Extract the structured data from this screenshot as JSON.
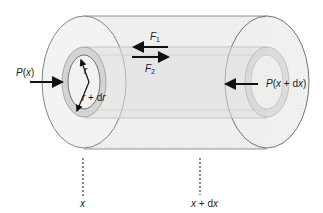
{
  "diagram": {
    "type": "fluid element cylinder (annular shell)",
    "labels": {
      "pressure_left": "P(x)",
      "pressure_right": "P(x + dx)",
      "force_1": "F",
      "force_1_sub": "1",
      "force_2": "F",
      "force_2_sub": "2",
      "radius_inner": "r",
      "radius_outer": "r + dr",
      "position_left": "x",
      "position_right": "x + dx"
    },
    "colors": {
      "outline": "#555555",
      "fill_outer": "#eeeeee",
      "fill_shell": "#d9d9d9",
      "arrow": "#111111"
    }
  }
}
